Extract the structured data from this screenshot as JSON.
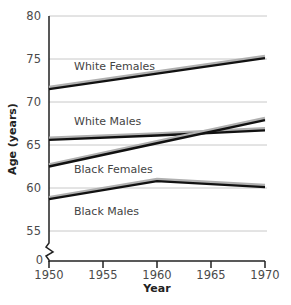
{
  "chart_data": {
    "type": "line",
    "title": "",
    "xlabel": "Year",
    "ylabel": "Age (years)",
    "x": [
      1950,
      1960,
      1970
    ],
    "x_ticks": [
      1950,
      1955,
      1960,
      1965,
      1970
    ],
    "y_ticks": [
      0,
      55,
      60,
      65,
      70,
      75,
      80
    ],
    "ylim": [
      55,
      80
    ],
    "axis_break": true,
    "grid": "horizontal",
    "legend": "inline labels",
    "series": [
      {
        "name": "White Females",
        "values": [
          71.5,
          73.3,
          75.1
        ]
      },
      {
        "name": "White Males",
        "values": [
          65.6,
          66.1,
          66.7
        ]
      },
      {
        "name": "Black Females",
        "values": [
          62.5,
          65.2,
          67.9
        ]
      },
      {
        "name": "Black Males",
        "values": [
          58.7,
          60.8,
          60.1
        ]
      }
    ]
  },
  "labels": {
    "xlabel": "Year",
    "ylabel": "Age (years)",
    "y_ticks": [
      "80",
      "75",
      "70",
      "65",
      "60",
      "55",
      "0"
    ],
    "x_ticks": [
      "1950",
      "1955",
      "1960",
      "1965",
      "1970"
    ],
    "series": [
      "White Females",
      "White Males",
      "Black Females",
      "Black Males"
    ]
  },
  "colors": {
    "line": "#111111",
    "line_shadow": "#b0b0b0",
    "grid": "#c8c8c8",
    "axis": "#222222"
  }
}
